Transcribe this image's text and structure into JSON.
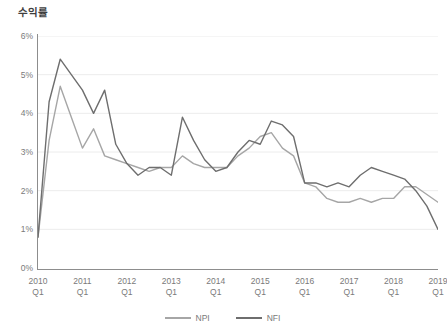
{
  "chart_data": {
    "type": "line",
    "title": "수익률",
    "xlabel": "",
    "ylabel": "",
    "ylim": [
      0,
      6
    ],
    "ytick_values": [
      0,
      1,
      2,
      3,
      4,
      5,
      6
    ],
    "ytick_labels": [
      "0%",
      "1%",
      "2%",
      "3%",
      "4%",
      "5%",
      "6%"
    ],
    "grid": true,
    "legend_position": "bottom",
    "x": [
      "2010 Q1",
      "2010 Q2",
      "2010 Q3",
      "2010 Q4",
      "2011 Q1",
      "2011 Q2",
      "2011 Q3",
      "2011 Q4",
      "2012 Q1",
      "2012 Q2",
      "2012 Q3",
      "2012 Q4",
      "2013 Q1",
      "2013 Q2",
      "2013 Q3",
      "2013 Q4",
      "2014 Q1",
      "2014 Q2",
      "2014 Q3",
      "2014 Q4",
      "2015 Q1",
      "2015 Q2",
      "2015 Q3",
      "2015 Q4",
      "2016 Q1",
      "2016 Q2",
      "2016 Q3",
      "2016 Q4",
      "2017 Q1",
      "2017 Q2",
      "2017 Q3",
      "2017 Q4",
      "2018 Q1",
      "2018 Q2",
      "2018 Q3",
      "2018 Q4",
      "2019 Q1"
    ],
    "xtick_labels": [
      {
        "year": "2010",
        "quarter": "Q1"
      },
      {
        "year": "2011",
        "quarter": "Q1"
      },
      {
        "year": "2012",
        "quarter": "Q1"
      },
      {
        "year": "2013",
        "quarter": "Q1"
      },
      {
        "year": "2014",
        "quarter": "Q1"
      },
      {
        "year": "2015",
        "quarter": "Q1"
      },
      {
        "year": "2016",
        "quarter": "Q1"
      },
      {
        "year": "2017",
        "quarter": "Q1"
      },
      {
        "year": "2018",
        "quarter": "Q1"
      },
      {
        "year": "2019",
        "quarter": "Q1"
      }
    ],
    "xtick_indices": [
      0,
      4,
      8,
      12,
      16,
      20,
      24,
      28,
      32,
      36
    ],
    "series": [
      {
        "name": "NPI",
        "color": "#a6a6a6",
        "values": [
          0.8,
          3.3,
          4.7,
          3.9,
          3.1,
          3.6,
          2.9,
          2.8,
          2.7,
          2.6,
          2.5,
          2.6,
          2.6,
          2.9,
          2.7,
          2.6,
          2.6,
          2.6,
          2.9,
          3.1,
          3.4,
          3.5,
          3.1,
          2.9,
          2.2,
          2.1,
          1.8,
          1.7,
          1.7,
          1.8,
          1.7,
          1.8,
          1.8,
          2.1,
          2.1,
          1.9,
          1.7
        ]
      },
      {
        "name": "NFI",
        "color": "#6e6e6e",
        "values": [
          0.8,
          4.3,
          5.4,
          5.0,
          4.6,
          4.0,
          4.6,
          3.2,
          2.7,
          2.4,
          2.6,
          2.6,
          2.4,
          3.9,
          3.3,
          2.8,
          2.5,
          2.6,
          3.0,
          3.3,
          3.2,
          3.8,
          3.7,
          3.4,
          2.2,
          2.2,
          2.1,
          2.2,
          2.1,
          2.4,
          2.6,
          2.5,
          2.4,
          2.3,
          2.0,
          1.6,
          1.0
        ]
      }
    ]
  },
  "legend": {
    "entries": [
      {
        "label": "NPI",
        "color": "#a6a6a6"
      },
      {
        "label": "NFI",
        "color": "#6e6e6e"
      }
    ]
  },
  "colors": {
    "npi": "#a6a6a6",
    "nfi": "#6e6e6e",
    "grid": "#ececec",
    "axis": "#8d8d8d",
    "text": "#7a7a7a",
    "title": "#3f3f3f",
    "background": "#ffffff"
  }
}
